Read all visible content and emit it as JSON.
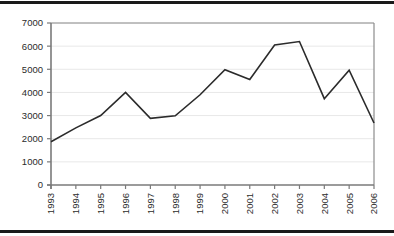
{
  "figure": {
    "name": "line-chart-figure",
    "background_color": "#ffffff",
    "rule_color": "#1a1a1a"
  },
  "chart_data": {
    "type": "line",
    "title": "",
    "subtitle": "",
    "xlabel": "",
    "ylabel": "",
    "categories": [
      "1993",
      "1994",
      "1995",
      "1996",
      "1997",
      "1998",
      "1999",
      "2000",
      "2001",
      "2002",
      "2003",
      "2004",
      "2005",
      "2006"
    ],
    "values": [
      1870,
      2470,
      3000,
      4000,
      2880,
      2990,
      3900,
      4980,
      4560,
      6050,
      6200,
      3730,
      4960,
      2680
    ],
    "series": [
      {
        "name": "series-1",
        "values": [
          1870,
          2470,
          3000,
          4000,
          2880,
          2990,
          3900,
          4980,
          4560,
          6050,
          6200,
          3730,
          4960,
          2680
        ],
        "color": "#2b2b2b"
      }
    ],
    "ylim": [
      0,
      7000
    ],
    "yticks": [
      0,
      1000,
      2000,
      3000,
      4000,
      5000,
      6000,
      7000
    ],
    "ytick_labels": [
      "0",
      "1000",
      "2000",
      "3000",
      "4000",
      "5000",
      "6000",
      "7000"
    ],
    "xtick_labels": [
      "1993",
      "1994",
      "1995",
      "1996",
      "1997",
      "1998",
      "1999",
      "2000",
      "2001",
      "2002",
      "2003",
      "2004",
      "2005",
      "2006"
    ],
    "xtick_rotation": -90,
    "grid": true,
    "grid_color": "#e8e8e8",
    "axis_color": "#7a7a7a",
    "plot_border_color": "#8c8c8c",
    "legend": null,
    "legend_position": "none",
    "annotations": []
  }
}
